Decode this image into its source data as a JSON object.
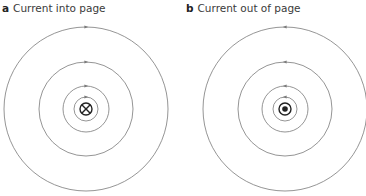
{
  "panels": [
    {
      "letter": "a",
      "title": "Current into page",
      "center": [
        86,
        109
      ],
      "radii": [
        82,
        47,
        23,
        12
      ],
      "conductor_symbol": "cross",
      "field_direction": "clockwise"
    },
    {
      "letter": "b",
      "title": "Current out of page",
      "center": [
        285,
        109
      ],
      "radii": [
        82,
        47,
        23,
        12
      ],
      "conductor_symbol": "dot",
      "field_direction": "anticlockwise"
    }
  ],
  "colors": {
    "field_line": "#7a7a7a",
    "conductor": "#222222",
    "label": "#3a3a3a"
  }
}
